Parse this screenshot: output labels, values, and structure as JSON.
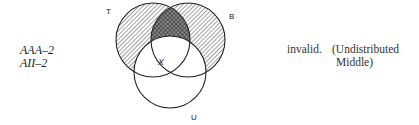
{
  "forms": [
    {
      "label": "AAA–2"
    },
    {
      "label": "AII–2"
    }
  ],
  "diagram": {
    "type": "venn-3",
    "sets": {
      "T": {
        "label": "T",
        "shading": "hatched"
      },
      "B": {
        "label": "B",
        "shading": "hatched"
      },
      "U": {
        "label": "U",
        "shading": "none"
      }
    },
    "intersection_TB_minus_U": "cross-hatched",
    "mark": {
      "label": "X",
      "region": "on boundary of T∩U"
    }
  },
  "verdict": {
    "result": "invalid.",
    "reason_line1": "(Undistributed",
    "reason_line2": "Middle)"
  },
  "colors": {
    "stroke": "#222222",
    "hatch": "#555555"
  }
}
